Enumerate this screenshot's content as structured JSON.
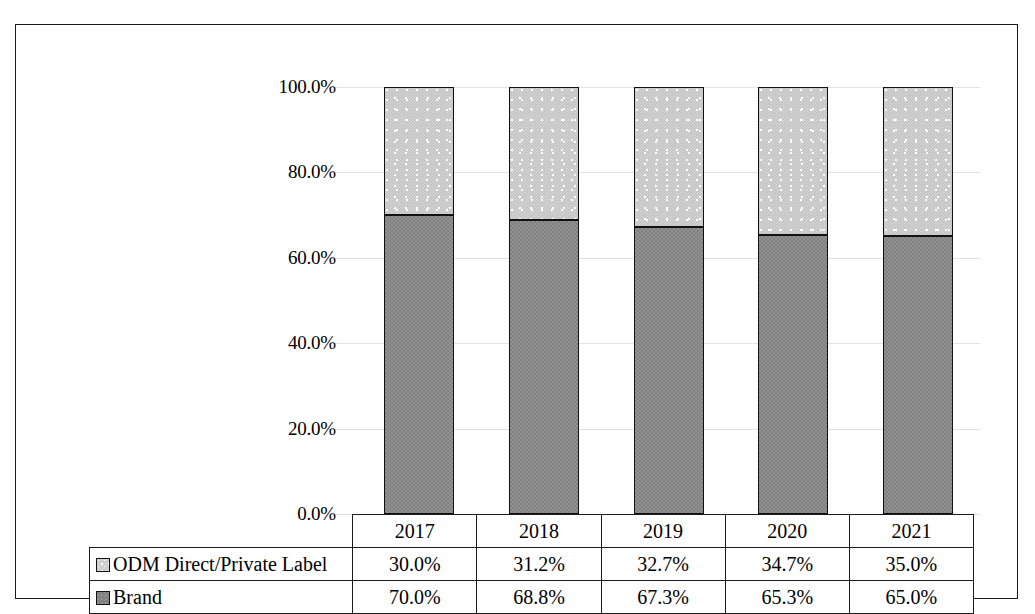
{
  "chart_data": {
    "type": "bar",
    "subtype": "stacked-100-percent",
    "title": "",
    "subtitle": "",
    "xlabel": "",
    "ylabel": "",
    "categories": [
      "2017",
      "2018",
      "2019",
      "2020",
      "2021"
    ],
    "series": [
      {
        "name": "ODM Direct/Private Label",
        "values": [
          30.0,
          31.2,
          32.7,
          34.7,
          35.0
        ],
        "value_labels": [
          "30.0%",
          "31.2%",
          "32.7%",
          "34.7%",
          "35.0%"
        ],
        "swatch": "light-speckled",
        "color": "#c3c3c3"
      },
      {
        "name": "Brand",
        "values": [
          70.0,
          68.8,
          67.3,
          65.3,
          65.0
        ],
        "value_labels": [
          "70.0%",
          "68.8%",
          "67.3%",
          "65.3%",
          "65.0%"
        ],
        "swatch": "solid-gray",
        "color": "#808080"
      }
    ],
    "stack_order": [
      "Brand",
      "ODM Direct/Private Label"
    ],
    "ylim": [
      0,
      100
    ],
    "ytick_values": [
      100.0,
      80.0,
      60.0,
      40.0,
      20.0,
      0.0
    ],
    "ytick_labels": [
      "100.0%",
      "80.0%",
      "60.0%",
      "40.0%",
      "20.0%",
      "0.0%"
    ],
    "grid": true,
    "grid_color": "#e2e2e2",
    "legend_position": "data-table-left-column",
    "has_data_table": true
  },
  "table": {
    "header_row": [
      "",
      "2017",
      "2018",
      "2019",
      "2020",
      "2021"
    ],
    "rows": [
      {
        "label": "ODM Direct/Private Label",
        "swatch": "light-speckled",
        "cells": [
          "30.0%",
          "31.2%",
          "32.7%",
          "34.7%",
          "35.0%"
        ]
      },
      {
        "label": "Brand",
        "swatch": "solid-gray",
        "cells": [
          "70.0%",
          "68.8%",
          "67.3%",
          "65.3%",
          "65.0%"
        ]
      }
    ]
  },
  "axis": {
    "y_labels": [
      "100.0%",
      "80.0%",
      "60.0%",
      "40.0%",
      "20.0%",
      "0.0%"
    ]
  },
  "colors": {
    "brand_fill": "#808080",
    "odm_fill": "#c3c3c3",
    "border": "#1a1a1a",
    "gridline": "#e2e2e2",
    "background": "#ffffff"
  }
}
